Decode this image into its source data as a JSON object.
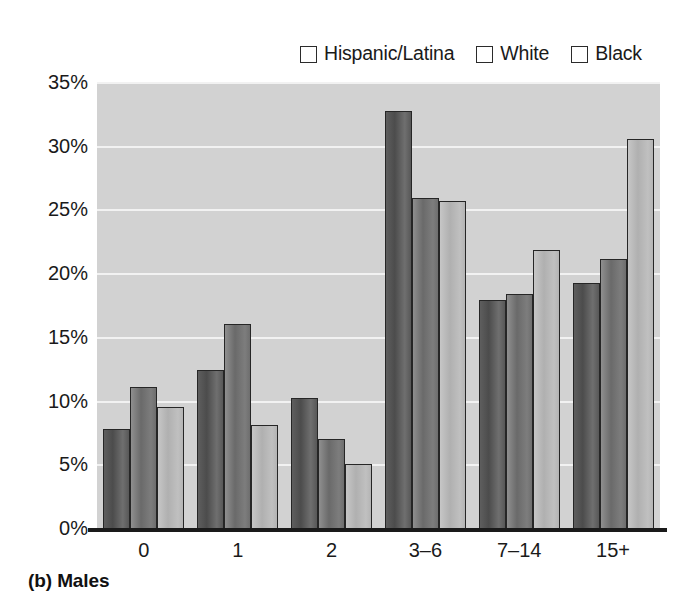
{
  "figure": {
    "caption": "(b) Males"
  },
  "legend": {
    "position": "top-right",
    "items": [
      {
        "label": "Hispanic/Latina",
        "color": "#555555",
        "swatch_icon": "legend-swatch-icon"
      },
      {
        "label": "White",
        "color": "#767676",
        "swatch_icon": "legend-swatch-icon"
      },
      {
        "label": "Black",
        "color": "#bbbbbb",
        "swatch_icon": "legend-swatch-icon"
      }
    ]
  },
  "axes": {
    "y_ticks": [
      "0%",
      "5%",
      "10%",
      "15%",
      "20%",
      "25%",
      "30%",
      "35%"
    ],
    "x_ticks": [
      "0",
      "1",
      "2",
      "3–6",
      "7–14",
      "15+"
    ]
  },
  "chart_data": {
    "type": "bar",
    "title": "(b) Males",
    "xlabel": "",
    "ylabel": "",
    "ylim": [
      0,
      35
    ],
    "ytick_values": [
      0,
      5,
      10,
      15,
      20,
      25,
      30,
      35
    ],
    "ytick_labels": [
      "0%",
      "5%",
      "10%",
      "15%",
      "20%",
      "25%",
      "30%",
      "35%"
    ],
    "grid": true,
    "grid_axis": "y",
    "legend_position": "top-right",
    "categories": [
      "0",
      "1",
      "2",
      "3–6",
      "7–14",
      "15+"
    ],
    "series": [
      {
        "name": "Hispanic/Latina",
        "color": "#555555",
        "values": [
          7.8,
          12.4,
          10.2,
          32.7,
          17.9,
          19.2
        ]
      },
      {
        "name": "White",
        "color": "#767676",
        "values": [
          11.1,
          16.0,
          7.0,
          25.9,
          18.4,
          21.1
        ]
      },
      {
        "name": "Black",
        "color": "#bbbbbb",
        "values": [
          9.5,
          8.1,
          5.0,
          25.7,
          21.8,
          30.5
        ]
      }
    ]
  }
}
